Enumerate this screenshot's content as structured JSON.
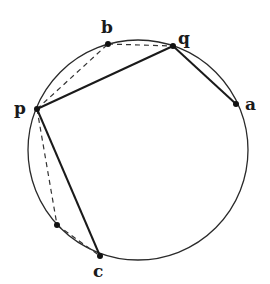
{
  "diagram": {
    "type": "circle-with-inscribed-points",
    "circle": {
      "cx": 138,
      "cy": 150,
      "r": 110
    },
    "points": [
      {
        "id": "b",
        "label": "b",
        "x": 108,
        "y": 44,
        "lx": 101,
        "ly": 33
      },
      {
        "id": "q",
        "label": "q",
        "x": 173,
        "y": 46,
        "lx": 180,
        "ly": 42
      },
      {
        "id": "p",
        "label": "p",
        "x": 37,
        "y": 109,
        "lx": 16,
        "ly": 114
      },
      {
        "id": "a",
        "label": "a",
        "x": 236,
        "y": 104,
        "lx": 246,
        "ly": 110
      },
      {
        "id": "d",
        "label": "",
        "x": 57,
        "y": 225
      },
      {
        "id": "c",
        "label": "c",
        "x": 100,
        "y": 256,
        "lx": 93,
        "ly": 277
      }
    ],
    "solid_segments": [
      [
        "p",
        "q"
      ],
      [
        "q",
        "a"
      ],
      [
        "p",
        "c"
      ]
    ],
    "dashed_segments": [
      [
        "p",
        "b"
      ],
      [
        "b",
        "q"
      ],
      [
        "p",
        "d"
      ],
      [
        "d",
        "c"
      ]
    ]
  },
  "labels": {
    "b": "b",
    "q": "q",
    "p": "p",
    "a": "a",
    "c": "c"
  }
}
